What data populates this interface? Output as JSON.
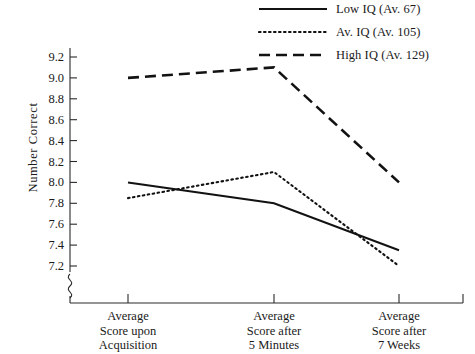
{
  "chart_data": {
    "type": "line",
    "title": "",
    "xlabel": "",
    "ylabel": "Number Correct",
    "ylim": [
      7.2,
      9.2
    ],
    "yticks": [
      "9.2",
      "9.0",
      "8.8",
      "8.6",
      "8.4",
      "8.2",
      "8.0",
      "7.8",
      "7.6",
      "7.4",
      "7.2"
    ],
    "axis_break": true,
    "grid": false,
    "legend_position": "top-right",
    "categories": [
      [
        "Average",
        "Score upon",
        "Acquisition"
      ],
      [
        "Average",
        "Score after",
        "5 Minutes"
      ],
      [
        "Average",
        "Score after",
        "7 Weeks"
      ]
    ],
    "series": [
      {
        "name": "Low IQ (Av. 67)",
        "style": "solid",
        "color": "#121212",
        "values": [
          8.0,
          7.8,
          7.35
        ]
      },
      {
        "name": "Av. IQ (Av. 105)",
        "style": "dotted",
        "color": "#121212",
        "values": [
          7.85,
          8.1,
          7.2
        ]
      },
      {
        "name": "High IQ (Av. 129)",
        "style": "dashed",
        "color": "#121212",
        "values": [
          9.0,
          9.1,
          8.0
        ]
      }
    ]
  },
  "legend": [
    {
      "label": "Low IQ (Av. 67)",
      "style": "solid"
    },
    {
      "label": "Av. IQ (Av. 105)",
      "style": "dotted"
    },
    {
      "label": "High IQ (Av. 129)",
      "style": "dashed"
    }
  ],
  "yaxis": {
    "title": "Number Correct",
    "ticks": [
      "9.2",
      "9.0",
      "8.8",
      "8.6",
      "8.4",
      "8.2",
      "8.0",
      "7.8",
      "7.6",
      "7.4",
      "7.2"
    ]
  },
  "xaxis": {
    "categories": [
      [
        "Average",
        "Score upon",
        "Acquisition"
      ],
      [
        "Average",
        "Score after",
        "5 Minutes"
      ],
      [
        "Average",
        "Score after",
        "7 Weeks"
      ]
    ]
  }
}
